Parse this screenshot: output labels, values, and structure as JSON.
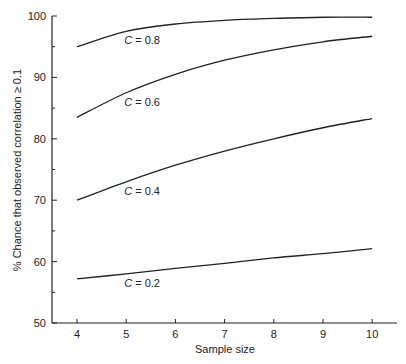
{
  "chart_data": {
    "type": "line",
    "title": "",
    "xlabel": "Sample size",
    "ylabel": "% Chance that observed correlation ≥ 0.1",
    "xlim": [
      4,
      10.5
    ],
    "ylim": [
      50,
      100
    ],
    "x": [
      4,
      5,
      6,
      7,
      8,
      9,
      10
    ],
    "x_ticks": [
      "4",
      "5",
      "6",
      "7",
      "8",
      "9",
      "10"
    ],
    "y_ticks": [
      "50",
      "60",
      "70",
      "80",
      "90",
      "100"
    ],
    "y_minor_ticks": [
      55,
      65,
      75,
      85,
      95
    ],
    "grid": false,
    "legend": "inline labels below each curve near x=5",
    "series": [
      {
        "name": "C = 0.8",
        "label_var": "C",
        "label_value": " = 0.8",
        "values": [
          95.0,
          97.5,
          98.7,
          99.3,
          99.6,
          99.8,
          99.8
        ]
      },
      {
        "name": "C = 0.6",
        "label_var": "C",
        "label_value": " = 0.6",
        "values": [
          83.5,
          87.5,
          90.5,
          92.8,
          94.5,
          95.8,
          96.7
        ]
      },
      {
        "name": "C = 0.4",
        "label_var": "C",
        "label_value": " = 0.4",
        "values": [
          70.0,
          73.0,
          75.7,
          78.0,
          80.0,
          81.8,
          83.3
        ]
      },
      {
        "name": "C = 0.2",
        "label_var": "C",
        "label_value": " = 0.2",
        "values": [
          57.2,
          58.0,
          58.9,
          59.7,
          60.6,
          61.3,
          62.1
        ]
      }
    ],
    "colors": {
      "line": "#222222",
      "axis": "#222222",
      "background": "#ffffff"
    }
  }
}
